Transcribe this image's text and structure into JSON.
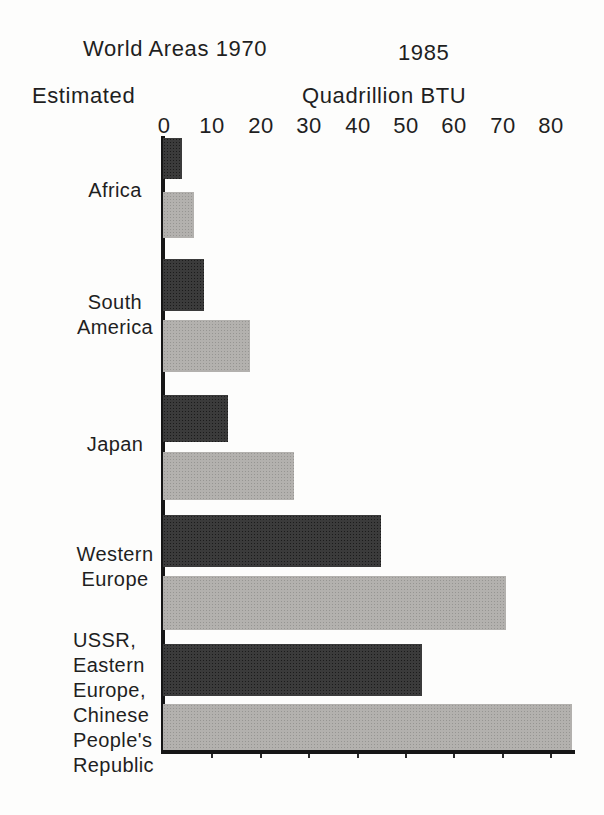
{
  "header": {
    "left_title": "World Areas 1970",
    "right_year": "1985",
    "estimated_label": "Estimated",
    "axis_title": "Quadrillion BTU"
  },
  "chart_data": {
    "type": "bar",
    "orientation": "horizontal",
    "title": "World Areas",
    "subtitle": "Estimated",
    "xlabel": "Quadrillion BTU",
    "ylabel": "",
    "xlim": [
      0,
      88
    ],
    "grid": false,
    "legend_position": "top-inline",
    "x_ticks": [
      "0",
      "10",
      "20",
      "30",
      "40",
      "50",
      "60",
      "70",
      "80"
    ],
    "categories": [
      "Africa",
      "South America",
      "Japan",
      "Western Europe",
      "USSR, Eastern Europe, Chinese People's Republic"
    ],
    "category_label_lines": [
      [
        "Africa"
      ],
      [
        "South",
        "America"
      ],
      [
        "Japan"
      ],
      [
        "Western",
        "Europe"
      ],
      [
        "USSR,",
        "Eastern",
        "Europe,",
        "Chinese",
        "People's",
        "Republic"
      ]
    ],
    "series": [
      {
        "name": "1970",
        "color": "#3b3b3b",
        "values": [
          4,
          8.5,
          13.5,
          45,
          53.5
        ]
      },
      {
        "name": "1985",
        "color": "#b3b1ae",
        "values": [
          6.5,
          18,
          27,
          71,
          84.5
        ]
      }
    ]
  },
  "colors": {
    "bar_1970": "#3b3b3b",
    "bar_1985": "#b3b1ae",
    "axis": "#161616",
    "text": "#1f1f1f",
    "background": "#fdfdfc"
  }
}
